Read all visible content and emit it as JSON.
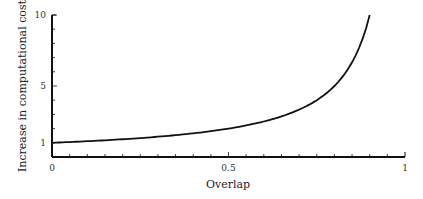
{
  "chart_data": {
    "type": "line",
    "title": "",
    "xlabel": "Overlap",
    "ylabel": "Increase in computational cost",
    "xlim": [
      0,
      1
    ],
    "ylim": [
      0,
      10
    ],
    "x_ticks": [
      {
        "value": 0,
        "label": "0"
      },
      {
        "value": 0.5,
        "label": "0.5"
      },
      {
        "value": 1,
        "label": "1"
      }
    ],
    "y_ticks": [
      {
        "value": 1,
        "label": "1"
      },
      {
        "value": 5,
        "label": "5"
      },
      {
        "value": 10,
        "label": "10"
      }
    ],
    "grid": false,
    "legend": null,
    "series": [
      {
        "name": "cost",
        "formula": "1/(1-overlap)",
        "x": [
          0,
          0.1,
          0.2,
          0.3,
          0.4,
          0.5,
          0.6,
          0.7,
          0.75,
          0.8,
          0.85,
          0.9
        ],
        "y": [
          1.0,
          1.11,
          1.25,
          1.43,
          1.67,
          2.0,
          2.5,
          3.33,
          4.0,
          5.0,
          6.67,
          10.0
        ]
      }
    ]
  }
}
